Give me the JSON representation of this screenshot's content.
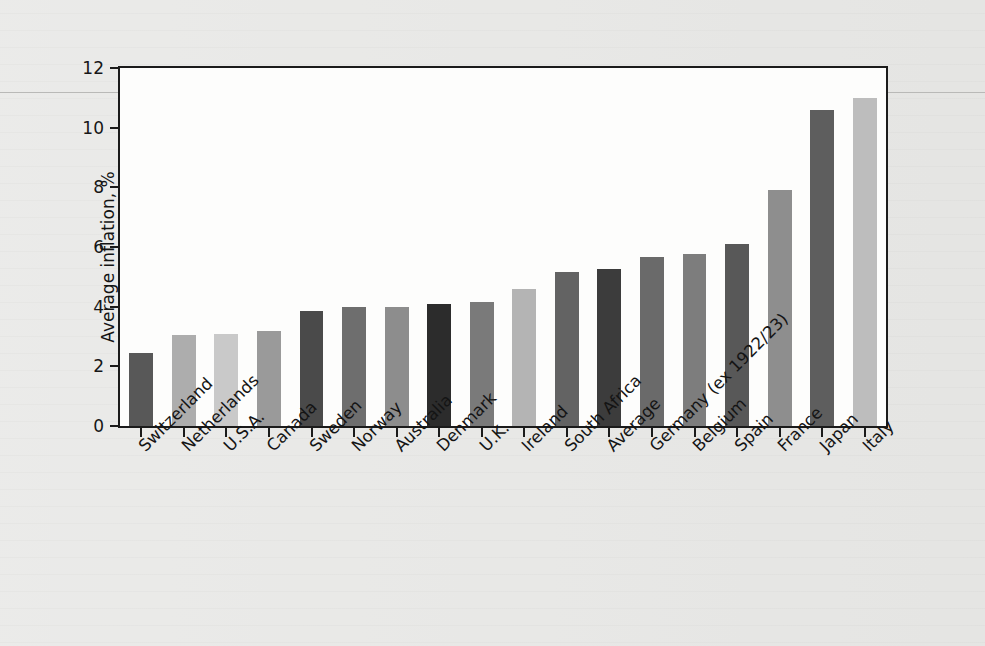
{
  "chart_data": {
    "type": "bar",
    "title": "",
    "xlabel": "",
    "ylabel": "Average inflation, %",
    "ylim": [
      0,
      12
    ],
    "yticks": [
      0,
      2,
      4,
      6,
      8,
      10,
      12
    ],
    "ytick_labels": [
      "0",
      "2",
      "4",
      "6",
      "8",
      "10",
      "12"
    ],
    "grid": false,
    "legend": null,
    "categories": [
      "Switzerland",
      "Netherlands",
      "U.S.A.",
      "Canada",
      "Sweden",
      "Norway",
      "Australia",
      "Denmark",
      "U.K.",
      "Ireland",
      "South Africa",
      "Average",
      "Germany (ex 1922/23)",
      "Belgium",
      "Spain",
      "France",
      "Japan",
      "Italy"
    ],
    "values": [
      2.45,
      3.05,
      3.1,
      3.2,
      3.85,
      4.0,
      4.0,
      4.1,
      4.15,
      4.6,
      5.15,
      5.25,
      5.65,
      5.75,
      6.1,
      7.9,
      10.6,
      11.0
    ],
    "bar_colors": [
      "#585858",
      "#adadad",
      "#c9c9c9",
      "#9a9a9a",
      "#4a4a4a",
      "#6e6e6e",
      "#8d8d8d",
      "#2c2c2c",
      "#7a7a7a",
      "#b4b4b4",
      "#636363",
      "#3c3c3c",
      "#6a6a6a",
      "#7d7d7d",
      "#585858",
      "#8e8e8e",
      "#5e5e5e",
      "#bdbdbd"
    ]
  },
  "figure": {
    "frame_color": "#1b1b1b",
    "plot_background": "#fdfdfc",
    "page_background": "#e8e8e6"
  }
}
